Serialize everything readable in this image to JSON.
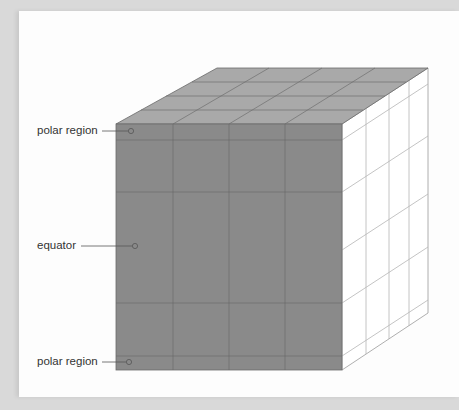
{
  "diagram": {
    "labels": {
      "top_polar": "polar region",
      "equator": "equator",
      "bottom_polar": "polar region"
    },
    "colors": {
      "front_face": "#8a8a8a",
      "top_face": "#a9a9a9",
      "side_face": "#ffffff",
      "grid_line": "#6e6e6e",
      "side_line": "#b0b0b0",
      "background": "#d9d9d9",
      "page": "#fdfdfd"
    }
  }
}
